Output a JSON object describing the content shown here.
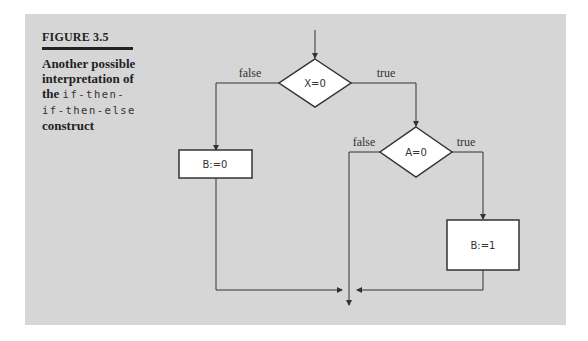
{
  "figure": {
    "label": "FIGURE 3.5",
    "caption": {
      "line1": "Another possible",
      "line2": "interpretation of",
      "line3_prefix": "the ",
      "line3_code": "if-then-",
      "line4_code": "if-then-else",
      "line5": "construct"
    }
  },
  "flowchart": {
    "decision1": {
      "text": "X=0",
      "false_label": "false",
      "true_label": "true"
    },
    "decision2": {
      "text": "A=0",
      "false_label": "false",
      "true_label": "true"
    },
    "box_left": {
      "text": "B:=0"
    },
    "box_right": {
      "text": "B:=1"
    }
  },
  "colors": {
    "panel": "#d6d6d6",
    "line": "#333333",
    "shape_fill": "#ffffff"
  }
}
